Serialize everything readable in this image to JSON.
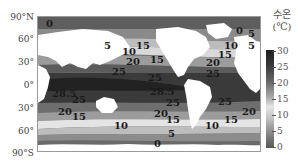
{
  "figure": {
    "type": "sea-surface-temperature-map",
    "y_axis_labels": [
      "90°N",
      "60°",
      "30°",
      "0°",
      "30°",
      "60°",
      "90°S"
    ],
    "legend": {
      "title_line1": "수온",
      "title_line2": "(℃)",
      "ticks": [
        "30",
        "25",
        "20",
        "15",
        "10",
        "5",
        "0"
      ],
      "colors": {
        "warm": "#1f1f1f",
        "mid": "#a9a9a9",
        "cool_light": "#e6e6e6",
        "cold": "#5a5a5a"
      }
    },
    "contour_labels": [
      {
        "text": "0",
        "region": "arctic-north-asia"
      },
      {
        "text": "5",
        "region": "north-pacific-west"
      },
      {
        "text": "10",
        "region": "north-pacific"
      },
      {
        "text": "15",
        "region": "north-pacific-east"
      },
      {
        "text": "20",
        "region": "north-pacific"
      },
      {
        "text": "25",
        "region": "north-pacific-west"
      },
      {
        "text": "15",
        "region": "north-pacific-far-east"
      },
      {
        "text": "25",
        "region": "north-pacific-east"
      },
      {
        "text": "0",
        "region": "north-atlantic-arctic"
      },
      {
        "text": "5",
        "region": "north-atlantic"
      },
      {
        "text": "10",
        "region": "north-atlantic"
      },
      {
        "text": "5",
        "region": "north-atlantic-east"
      },
      {
        "text": "15",
        "region": "north-atlantic"
      },
      {
        "text": "20",
        "region": "north-atlantic"
      },
      {
        "text": "25",
        "region": "north-atlantic"
      },
      {
        "text": "28.5",
        "region": "indian-ocean"
      },
      {
        "text": "25",
        "region": "indian-ocean-south"
      },
      {
        "text": "28.5",
        "region": "west-pacific-warm-pool"
      },
      {
        "text": "25",
        "region": "south-pacific-east"
      },
      {
        "text": "25",
        "region": "south-atlantic"
      },
      {
        "text": "20",
        "region": "south-indian"
      },
      {
        "text": "15",
        "region": "south-indian"
      },
      {
        "text": "10",
        "region": "south-of-australia"
      },
      {
        "text": "20",
        "region": "south-pacific"
      },
      {
        "text": "15",
        "region": "south-pacific"
      },
      {
        "text": "10",
        "region": "south-pacific-east"
      },
      {
        "text": "5",
        "region": "south-pacific"
      },
      {
        "text": "0",
        "region": "southern-ocean"
      },
      {
        "text": "20",
        "region": "south-atlantic"
      },
      {
        "text": "15",
        "region": "south-atlantic"
      }
    ]
  }
}
